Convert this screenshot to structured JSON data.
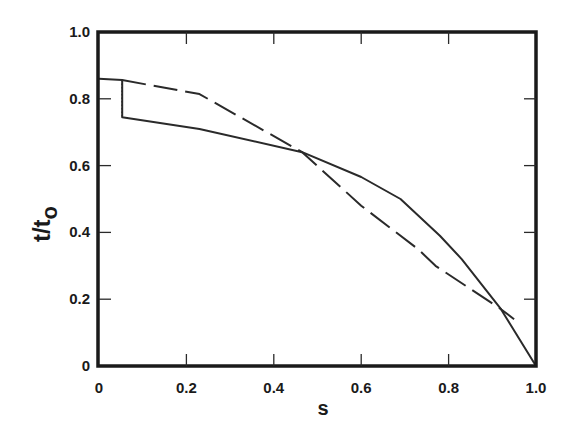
{
  "chart_data": {
    "type": "line",
    "title": "",
    "xlabel": "s",
    "ylabel": "t/t_o",
    "ylabel_main": "t/t",
    "ylabel_sub": "o",
    "xlim": [
      0,
      1.0
    ],
    "ylim": [
      0,
      1.0
    ],
    "grid": false,
    "legend": null,
    "x_ticks": [
      "0",
      "0.2",
      "0.4",
      "0.6",
      "0.8",
      "1.0"
    ],
    "y_ticks": [
      "0",
      "0.2",
      "0.4",
      "0.6",
      "0.8",
      "1.0"
    ],
    "series": [
      {
        "name": "solid",
        "style": "solid",
        "x": [
          0.0,
          0.053,
          0.053,
          0.23,
          0.465,
          0.6,
          0.69,
          0.78,
          0.83,
          0.92,
          1.0
        ],
        "y": [
          0.86,
          0.856,
          0.745,
          0.71,
          0.64,
          0.566,
          0.5,
          0.39,
          0.32,
          0.17,
          0.0
        ]
      },
      {
        "name": "dashed",
        "style": "dashed",
        "x": [
          0.053,
          0.23,
          0.465,
          0.6,
          0.73,
          0.77,
          0.92,
          0.95
        ],
        "y": [
          0.856,
          0.814,
          0.64,
          0.48,
          0.35,
          0.3,
          0.17,
          0.14
        ]
      },
      {
        "name": "dotted-step",
        "style": "dotted",
        "x": [
          0.053,
          0.053
        ],
        "y": [
          0.856,
          0.745
        ]
      }
    ]
  }
}
